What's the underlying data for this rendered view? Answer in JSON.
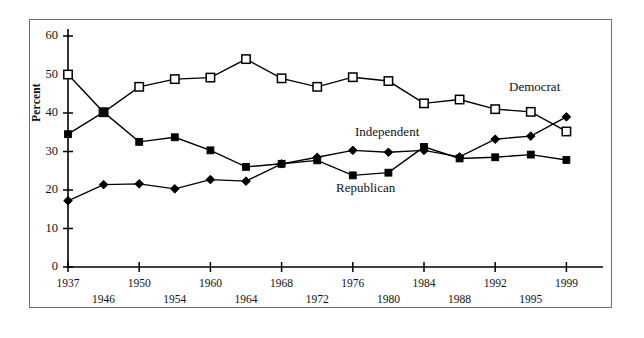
{
  "figure": {
    "background": "#ffffff",
    "frame_color": "#6e6e6e",
    "ink_color": "#000000"
  },
  "axis": {
    "ylabel": "Percent",
    "yticks": [
      "0",
      "10",
      "20",
      "30",
      "40",
      "50",
      "60"
    ],
    "xticks_row1": [
      "1937",
      "1950",
      "1960",
      "1968",
      "1976",
      "1984",
      "1992",
      "1999"
    ],
    "xticks_row2": [
      "1946",
      "1954",
      "1964",
      "1972",
      "1980",
      "1988",
      "1995"
    ]
  },
  "labels": {
    "democrat": "Democrat",
    "independent": "Independent",
    "republican": "Republican"
  },
  "chart_data": {
    "type": "line",
    "title": "",
    "xlabel": "",
    "ylabel": "Percent",
    "ylim": [
      0,
      60
    ],
    "ytick_values": [
      0,
      10,
      20,
      30,
      40,
      50,
      60
    ],
    "grid": false,
    "legend": "inline-annotations",
    "x": [
      1937,
      1946,
      1950,
      1954,
      1960,
      1964,
      1968,
      1972,
      1976,
      1980,
      1984,
      1988,
      1992,
      1995,
      1999
    ],
    "xtick_labels": [
      "1937",
      "1946",
      "1950",
      "1954",
      "1960",
      "1964",
      "1968",
      "1972",
      "1976",
      "1980",
      "1984",
      "1988",
      "1992",
      "1995",
      "1999"
    ],
    "series": [
      {
        "name": "Democrat",
        "marker": "open-square",
        "values": [
          50.0,
          40.2,
          46.8,
          48.8,
          49.2,
          54.0,
          49.0,
          46.8,
          49.3,
          48.3,
          42.5,
          43.5,
          41.0,
          40.3,
          35.2
        ]
      },
      {
        "name": "Republican",
        "marker": "filled-square",
        "values": [
          34.5,
          40.2,
          32.5,
          33.7,
          30.3,
          26.0,
          26.8,
          27.7,
          23.8,
          24.5,
          31.2,
          28.2,
          28.5,
          29.2,
          27.8
        ]
      },
      {
        "name": "Independent",
        "marker": "filled-diamond",
        "values": [
          17.2,
          21.4,
          21.6,
          20.3,
          22.7,
          22.3,
          26.8,
          28.5,
          30.3,
          29.8,
          30.3,
          28.6,
          33.2,
          34.0,
          39.0
        ]
      }
    ]
  }
}
